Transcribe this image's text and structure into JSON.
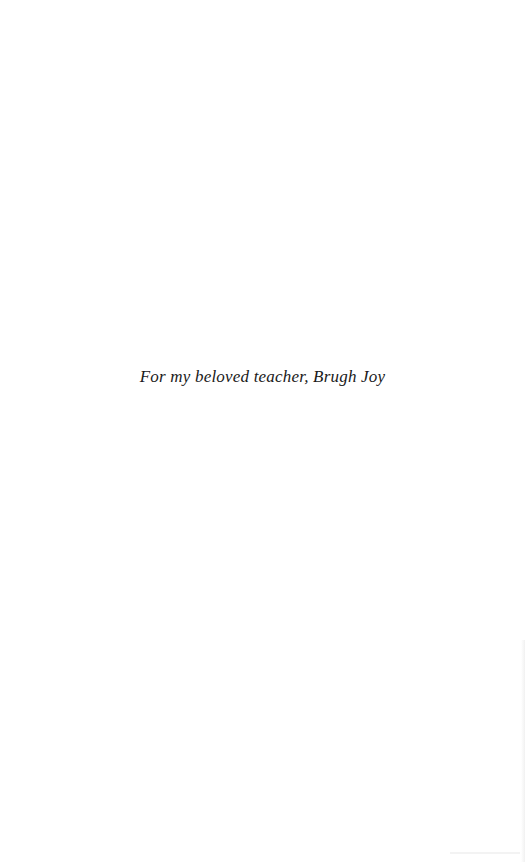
{
  "page": {
    "type": "dedication",
    "dedication_text": "For my beloved teacher, Brugh Joy"
  },
  "colors": {
    "background": "#ffffff",
    "text": "#1a1a1a"
  }
}
